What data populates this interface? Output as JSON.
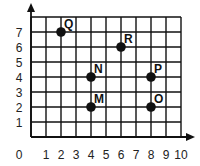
{
  "chart_data": {
    "type": "scatter",
    "title": "",
    "xlabel": "",
    "ylabel": "",
    "xlim": [
      0,
      10
    ],
    "ylim": [
      0,
      8
    ],
    "grid": true,
    "x_ticks": [
      "0",
      "1",
      "2",
      "3",
      "4",
      "5",
      "6",
      "7",
      "8",
      "9",
      "10"
    ],
    "y_ticks": [
      "1",
      "2",
      "3",
      "4",
      "5",
      "6",
      "7"
    ],
    "points": [
      {
        "label": "Q",
        "x": 2,
        "y": 7
      },
      {
        "label": "R",
        "x": 6,
        "y": 6
      },
      {
        "label": "N",
        "x": 4,
        "y": 4
      },
      {
        "label": "P",
        "x": 8,
        "y": 4
      },
      {
        "label": "M",
        "x": 4,
        "y": 2
      },
      {
        "label": "O",
        "x": 8,
        "y": 2
      }
    ],
    "colors": {
      "grid": "#111111",
      "point": "#111111"
    }
  }
}
